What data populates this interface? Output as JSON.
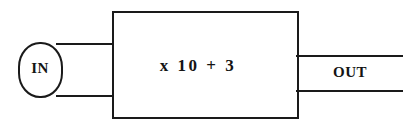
{
  "diagram": {
    "type": "function-machine",
    "background_color": "#ffffff",
    "stroke_color": "#1a1a1a",
    "text_color": "#141414",
    "input": {
      "label": "IN",
      "shape": "rounded-oval"
    },
    "machine": {
      "operation_label": "x 10 + 3",
      "shape": "rectangle"
    },
    "output": {
      "label": "OUT",
      "shape": "open-channel"
    },
    "connectors": {
      "input_top_label": "input-top-wire",
      "input_bottom_label": "input-bottom-wire",
      "output_top_label": "output-top-wire",
      "output_bottom_label": "output-bottom-wire"
    }
  }
}
